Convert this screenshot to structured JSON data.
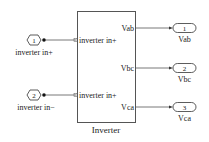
{
  "block": {
    "name": "Inverter",
    "input_ports": [
      "inverter in+",
      "inverter in+"
    ],
    "output_ports": [
      "Vab",
      "Vbc",
      "Vca"
    ]
  },
  "inports": [
    {
      "number": "1",
      "label": "inverter in+"
    },
    {
      "number": "2",
      "label": "inverter in−"
    }
  ],
  "outports": [
    {
      "number": "1",
      "label": "Vab"
    },
    {
      "number": "2",
      "label": "Vbc"
    },
    {
      "number": "3",
      "label": "Vca"
    }
  ],
  "colors": {
    "line": "#333333",
    "background": "#ffffff"
  }
}
